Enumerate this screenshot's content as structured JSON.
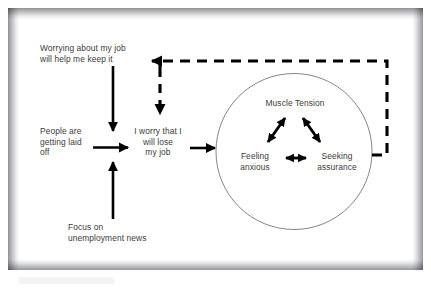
{
  "diagram": {
    "frame": {
      "border_color": "#96979a",
      "background_color": "#ffffff"
    },
    "style": {
      "stroke_color": "#000000",
      "text_color": "#3b3b3b",
      "circle_stroke_color": "#6e6e6e"
    },
    "nodes": {
      "belief": "Worrying about my job\nwill help me keep it",
      "trigger_layoffs": "People are\ngetting laid\noff",
      "worry_thought": "I worry that I\nwill lose\nmy job",
      "trigger_news": "Focus on\nunemployment news",
      "muscle_tension": "Muscle Tension",
      "feeling_anxious": "Feeling\nanxious",
      "seeking_assurance": "Seeking\nassurance"
    },
    "connectors": [
      {
        "name": "belief-to-worry",
        "from": "belief",
        "to": "worry_thought",
        "style": "solid",
        "direction": "down"
      },
      {
        "name": "layoffs-to-worry",
        "from": "trigger_layoffs",
        "to": "worry_thought",
        "style": "solid",
        "direction": "right"
      },
      {
        "name": "news-to-worry",
        "from": "trigger_news",
        "to": "worry_thought",
        "style": "solid",
        "direction": "up"
      },
      {
        "name": "worry-to-response-circle",
        "from": "worry_thought",
        "to": "response_circle",
        "style": "solid",
        "direction": "right"
      },
      {
        "name": "feedback-loop-to-belief",
        "from": "response_circle",
        "to": "belief",
        "style": "dashed",
        "direction": "left"
      },
      {
        "name": "feedback-loop-to-worry",
        "from": "response_circle",
        "to": "worry_thought",
        "style": "dashed",
        "direction": "down"
      },
      {
        "name": "tension-anxious-link",
        "from": "muscle_tension",
        "to": "feeling_anxious",
        "style": "solid",
        "direction": "double"
      },
      {
        "name": "tension-assurance-link",
        "from": "muscle_tension",
        "to": "seeking_assurance",
        "style": "solid",
        "direction": "double"
      },
      {
        "name": "anxious-assurance-link",
        "from": "feeling_anxious",
        "to": "seeking_assurance",
        "style": "solid",
        "direction": "double"
      }
    ]
  }
}
